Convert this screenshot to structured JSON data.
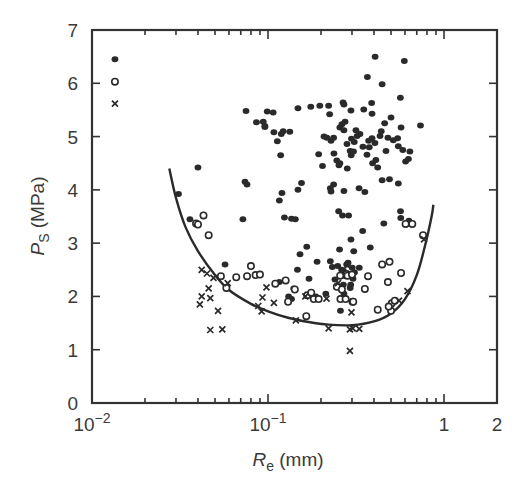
{
  "chart_data": {
    "type": "scatter",
    "title": "",
    "xlabel": "R_e (mm)",
    "xlabel_main": "R",
    "xlabel_sub": "e",
    "xlabel_unit": " (mm)",
    "ylabel": "P_S (MPa)",
    "ylabel_main": "P",
    "ylabel_sub": "S",
    "ylabel_unit": " (MPa)",
    "xscale": "log",
    "xlim": [
      0.01,
      2
    ],
    "ylim": [
      0,
      7
    ],
    "grid": false,
    "x_ticks": [
      {
        "value": 0.01,
        "base": "10",
        "exp": "−2"
      },
      {
        "value": 0.1,
        "base": "10",
        "exp": "−1"
      },
      {
        "value": 1,
        "base": "1",
        "exp": ""
      },
      {
        "value": 2,
        "base": "2",
        "exp": ""
      }
    ],
    "y_ticks": [
      0,
      1,
      2,
      3,
      4,
      5,
      6,
      7
    ],
    "legend": {
      "position": "upper-left-inside",
      "entries": [
        {
          "marker": "filled-circle",
          "x": 0.0135,
          "y": 6.45
        },
        {
          "marker": "open-circle",
          "x": 0.0135,
          "y": 6.03
        },
        {
          "marker": "cross",
          "x": 0.0135,
          "y": 5.62
        }
      ]
    },
    "series": [
      {
        "name": "filled",
        "marker": "filled-circle",
        "points": [
          [
            0.031,
            3.92
          ],
          [
            0.04,
            4.42
          ],
          [
            0.036,
            3.45
          ],
          [
            0.057,
            2.6
          ],
          [
            0.072,
            3.45
          ],
          [
            0.074,
            4.15
          ],
          [
            0.076,
            4.1
          ],
          [
            0.075,
            5.48
          ],
          [
            0.086,
            5.27
          ],
          [
            0.094,
            5.28
          ],
          [
            0.096,
            5.18
          ],
          [
            0.096,
            5.2
          ],
          [
            0.099,
            5.47
          ],
          [
            0.107,
            5.45
          ],
          [
            0.108,
            5.08
          ],
          [
            0.118,
            4.65
          ],
          [
            0.113,
            4.91
          ],
          [
            0.119,
            5.05
          ],
          [
            0.122,
            5.1
          ],
          [
            0.133,
            5.09
          ],
          [
            0.12,
            3.94
          ],
          [
            0.124,
            3.48
          ],
          [
            0.136,
            3.46
          ],
          [
            0.143,
            3.45
          ],
          [
            0.148,
            4.0
          ],
          [
            0.116,
            3.8
          ],
          [
            0.155,
            4.13
          ],
          [
            0.148,
            5.53
          ],
          [
            0.166,
            2.93
          ],
          [
            0.152,
            2.79
          ],
          [
            0.147,
            2.5
          ],
          [
            0.175,
            5.56
          ],
          [
            0.197,
            5.58
          ],
          [
            0.224,
            5.42
          ],
          [
            0.221,
            5.58
          ],
          [
            0.228,
            4.92
          ],
          [
            0.208,
            5.0
          ],
          [
            0.216,
            4.98
          ],
          [
            0.236,
            4.98
          ],
          [
            0.194,
            4.67
          ],
          [
            0.237,
            4.68
          ],
          [
            0.246,
            4.55
          ],
          [
            0.253,
            4.46
          ],
          [
            0.256,
            4.5
          ],
          [
            0.204,
            4.45
          ],
          [
            0.228,
            3.97
          ],
          [
            0.226,
            4.03
          ],
          [
            0.236,
            4.1
          ],
          [
            0.256,
            5.17
          ],
          [
            0.263,
            5.23
          ],
          [
            0.274,
            5.28
          ],
          [
            0.27,
            5.6
          ],
          [
            0.267,
            5.64
          ],
          [
            0.27,
            5.12
          ],
          [
            0.281,
            4.86
          ],
          [
            0.293,
            4.73
          ],
          [
            0.297,
            4.65
          ],
          [
            0.306,
            4.72
          ],
          [
            0.309,
            4.9
          ],
          [
            0.298,
            4.96
          ],
          [
            0.321,
            5.01
          ],
          [
            0.316,
            5.12
          ],
          [
            0.333,
            5.05
          ],
          [
            0.346,
            4.81
          ],
          [
            0.365,
            4.66
          ],
          [
            0.376,
            4.8
          ],
          [
            0.373,
            4.92
          ],
          [
            0.39,
            4.97
          ],
          [
            0.405,
            4.88
          ],
          [
            0.41,
            4.56
          ],
          [
            0.393,
            4.5
          ],
          [
            0.42,
            4.42
          ],
          [
            0.433,
            5.01
          ],
          [
            0.44,
            5.1
          ],
          [
            0.468,
            4.73
          ],
          [
            0.48,
            4.98
          ],
          [
            0.515,
            4.93
          ],
          [
            0.55,
            4.82
          ],
          [
            0.583,
            4.75
          ],
          [
            0.605,
            4.53
          ],
          [
            0.55,
            4.12
          ],
          [
            0.545,
            4.97
          ],
          [
            0.57,
            5.17
          ],
          [
            0.46,
            5.25
          ],
          [
            0.5,
            5.36
          ],
          [
            0.388,
            5.63
          ],
          [
            0.445,
            5.98
          ],
          [
            0.367,
            6.12
          ],
          [
            0.406,
            6.5
          ],
          [
            0.595,
            6.42
          ],
          [
            0.565,
            5.73
          ],
          [
            0.628,
            4.58
          ],
          [
            0.64,
            4.72
          ],
          [
            0.735,
            5.21
          ],
          [
            0.39,
            5.43
          ],
          [
            0.35,
            5.51
          ],
          [
            0.296,
            5.49
          ],
          [
            0.282,
            4.4
          ],
          [
            0.27,
            3.98
          ],
          [
            0.252,
            3.6
          ],
          [
            0.265,
            3.52
          ],
          [
            0.287,
            3.52
          ],
          [
            0.329,
            4.03
          ],
          [
            0.355,
            3.96
          ],
          [
            0.445,
            4.18
          ],
          [
            0.49,
            4.2
          ],
          [
            0.566,
            3.6
          ],
          [
            0.568,
            3.47
          ],
          [
            0.632,
            3.42
          ],
          [
            0.455,
            3.37
          ],
          [
            0.345,
            3.23
          ],
          [
            0.296,
            3.07
          ],
          [
            0.255,
            2.88
          ],
          [
            0.301,
            2.54
          ],
          [
            0.307,
            2.85
          ],
          [
            0.381,
            2.92
          ],
          [
            0.19,
            2.65
          ],
          [
            0.171,
            2.33
          ],
          [
            0.187,
            2.0
          ],
          [
            0.213,
            2.05
          ],
          [
            0.249,
            2.57
          ],
          [
            0.262,
            2.5
          ],
          [
            0.268,
            2.48
          ],
          [
            0.28,
            2.6
          ],
          [
            0.285,
            2.63
          ],
          [
            0.276,
            2.38
          ],
          [
            0.268,
            2.22
          ],
          [
            0.295,
            2.22
          ],
          [
            0.304,
            2.33
          ],
          [
            0.31,
            2.45
          ],
          [
            0.33,
            2.54
          ],
          [
            0.293,
            2.16
          ],
          [
            0.27,
            2.05
          ],
          [
            0.258,
            1.73
          ],
          [
            0.24,
            2.32
          ],
          [
            0.232,
            2.55
          ],
          [
            0.226,
            2.66
          ],
          [
            0.14,
            2.15
          ],
          [
            0.136,
            1.95
          ],
          [
            0.131,
            2.0
          ],
          [
            0.116,
            2.27
          ]
        ]
      },
      {
        "name": "open",
        "marker": "open-circle",
        "points": [
          [
            0.039,
            3.37
          ],
          [
            0.04,
            3.35
          ],
          [
            0.043,
            3.52
          ],
          [
            0.046,
            3.15
          ],
          [
            0.054,
            2.38
          ],
          [
            0.058,
            2.16
          ],
          [
            0.066,
            2.36
          ],
          [
            0.076,
            2.38
          ],
          [
            0.08,
            2.57
          ],
          [
            0.085,
            2.4
          ],
          [
            0.09,
            2.41
          ],
          [
            0.11,
            2.24
          ],
          [
            0.126,
            2.3
          ],
          [
            0.13,
            1.9
          ],
          [
            0.142,
            2.13
          ],
          [
            0.167,
            2.02
          ],
          [
            0.182,
            1.95
          ],
          [
            0.176,
            2.07
          ],
          [
            0.194,
            1.95
          ],
          [
            0.165,
            1.63
          ],
          [
            0.246,
            2.18
          ],
          [
            0.257,
            2.39
          ],
          [
            0.28,
            2.42
          ],
          [
            0.283,
            2.39
          ],
          [
            0.263,
            2.13
          ],
          [
            0.258,
            1.95
          ],
          [
            0.276,
            1.95
          ],
          [
            0.3,
            2.41
          ],
          [
            0.302,
            1.9
          ],
          [
            0.305,
            1.9
          ],
          [
            0.355,
            2.14
          ],
          [
            0.37,
            2.38
          ],
          [
            0.42,
            1.75
          ],
          [
            0.445,
            2.6
          ],
          [
            0.48,
            2.27
          ],
          [
            0.49,
            2.65
          ],
          [
            0.505,
            1.87
          ],
          [
            0.57,
            2.44
          ],
          [
            0.525,
            1.92
          ],
          [
            0.5,
            1.73
          ],
          [
            0.485,
            1.81
          ],
          [
            0.605,
            3.36
          ],
          [
            0.76,
            3.15
          ],
          [
            0.66,
            3.36
          ]
        ]
      },
      {
        "name": "cross",
        "marker": "cross",
        "points": [
          [
            0.042,
            2.5
          ],
          [
            0.045,
            2.43
          ],
          [
            0.049,
            2.35
          ],
          [
            0.046,
            2.15
          ],
          [
            0.042,
            2.0
          ],
          [
            0.047,
            1.97
          ],
          [
            0.041,
            1.85
          ],
          [
            0.052,
            1.73
          ],
          [
            0.047,
            1.37
          ],
          [
            0.055,
            1.38
          ],
          [
            0.059,
            2.25
          ],
          [
            0.088,
            1.82
          ],
          [
            0.093,
            1.98
          ],
          [
            0.092,
            1.72
          ],
          [
            0.098,
            2.17
          ],
          [
            0.108,
            1.88
          ],
          [
            0.144,
            1.55
          ],
          [
            0.163,
            2.0
          ],
          [
            0.221,
            1.4
          ],
          [
            0.215,
            1.96
          ],
          [
            0.282,
            2.58
          ],
          [
            0.292,
            1.38
          ],
          [
            0.303,
            1.4
          ],
          [
            0.33,
            1.39
          ],
          [
            0.292,
            0.98
          ],
          [
            0.25,
            2.25
          ],
          [
            0.298,
            1.7
          ],
          [
            0.555,
            1.92
          ],
          [
            0.62,
            2.1
          ],
          [
            0.77,
            3.07
          ]
        ]
      }
    ],
    "fit_curve": {
      "style": "solid",
      "points": [
        [
          0.0275,
          4.4
        ],
        [
          0.03,
          3.85
        ],
        [
          0.034,
          3.3
        ],
        [
          0.04,
          2.85
        ],
        [
          0.05,
          2.4
        ],
        [
          0.06,
          2.12
        ],
        [
          0.08,
          1.86
        ],
        [
          0.1,
          1.72
        ],
        [
          0.13,
          1.6
        ],
        [
          0.17,
          1.52
        ],
        [
          0.22,
          1.47
        ],
        [
          0.3,
          1.46
        ],
        [
          0.4,
          1.53
        ],
        [
          0.5,
          1.68
        ],
        [
          0.6,
          1.95
        ],
        [
          0.7,
          2.4
        ],
        [
          0.78,
          2.95
        ],
        [
          0.85,
          3.5
        ],
        [
          0.87,
          3.72
        ]
      ]
    }
  }
}
